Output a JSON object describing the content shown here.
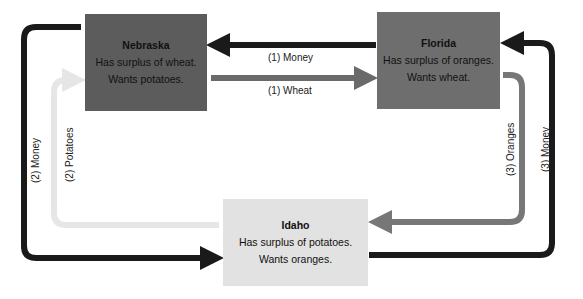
{
  "regions": {
    "nebraska": {
      "name": "Nebraska",
      "surplus": "Has surplus of wheat.",
      "wants": "Wants potatoes.",
      "color": "#5c5c5c"
    },
    "florida": {
      "name": "Florida",
      "surplus": "Has surplus of oranges.",
      "wants": "Wants wheat.",
      "color": "#6e6e6e"
    },
    "idaho": {
      "name": "Idaho",
      "surplus": "Has surplus of potatoes.",
      "wants": "Wants oranges.",
      "color": "#e2e2e2"
    }
  },
  "flows": [
    {
      "id": "money-1",
      "label": "(1)  Money",
      "from": "Florida",
      "to": "Nebraska",
      "color": "#1a1a1a"
    },
    {
      "id": "wheat-1",
      "label": "(1)  Wheat",
      "from": "Nebraska",
      "to": "Florida",
      "color": "#6a6a6a"
    },
    {
      "id": "money-2",
      "label": "(2)  Money",
      "from": "Nebraska",
      "to": "Idaho",
      "color": "#1a1a1a"
    },
    {
      "id": "potatoes-2",
      "label": "(2)  Potatoes",
      "from": "Idaho",
      "to": "Nebraska",
      "color": "#e6e6e6"
    },
    {
      "id": "oranges-3",
      "label": "(3)  Oranges",
      "from": "Florida",
      "to": "Idaho",
      "color": "#777777"
    },
    {
      "id": "money-3",
      "label": "(3)  Money",
      "from": "Idaho",
      "to": "Florida",
      "color": "#1a1a1a"
    }
  ]
}
